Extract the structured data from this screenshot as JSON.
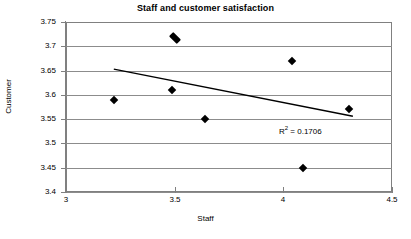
{
  "chart_data": {
    "type": "scatter",
    "title": "Staff and customer satisfaction",
    "xlabel": "Staff",
    "ylabel": "Customer",
    "xlim": [
      3,
      4.5
    ],
    "ylim": [
      3.4,
      3.75
    ],
    "xticks": [
      "3",
      "3.5",
      "4",
      "4.5"
    ],
    "xtick_values": [
      3,
      3.5,
      4,
      4.5
    ],
    "yticks": [
      "3.4",
      "3.45",
      "3.5",
      "3.55",
      "3.6",
      "3.65",
      "3.7",
      "3.75"
    ],
    "ytick_values": [
      3.4,
      3.45,
      3.5,
      3.55,
      3.6,
      3.65,
      3.7,
      3.75
    ],
    "grid": "horizontal",
    "legend": "none",
    "x": [
      3.22,
      3.49,
      3.49,
      3.52,
      3.64,
      4.04,
      4.09,
      4.3
    ],
    "y": [
      3.59,
      3.61,
      3.715,
      3.72,
      3.55,
      3.67,
      3.45,
      3.57
    ],
    "points": [
      {
        "x": 3.22,
        "y": 3.59,
        "marker": "diamond"
      },
      {
        "x": 3.49,
        "y": 3.61,
        "marker": "diamond"
      },
      {
        "x": 3.5,
        "y": 3.717,
        "marker": "diamond-double"
      },
      {
        "x": 3.64,
        "y": 3.55,
        "marker": "diamond"
      },
      {
        "x": 4.04,
        "y": 3.67,
        "marker": "diamond"
      },
      {
        "x": 4.09,
        "y": 3.45,
        "marker": "diamond"
      },
      {
        "x": 4.3,
        "y": 3.57,
        "marker": "diamond"
      }
    ],
    "trendline": {
      "type": "linear",
      "x_start": 3.22,
      "y_start": 3.653,
      "x_end": 4.32,
      "y_end": 3.556,
      "r_squared": 0.1706
    },
    "annotations": [
      {
        "text_prefix": "R",
        "text_sup": "2",
        "text_suffix": " = 0.1706",
        "x": 3.98,
        "y": 3.527
      }
    ],
    "colors": {
      "marker": "#000000",
      "trendline": "#000000",
      "gridline": "#8c8c8c",
      "axis": "#808080",
      "background": "#ffffff",
      "text": "#000000"
    }
  },
  "annotation_text": {
    "r2_full": "R2 = 0.1706",
    "r2_prefix": "R",
    "r2_sup": "2",
    "r2_suffix": " = 0.1706"
  }
}
